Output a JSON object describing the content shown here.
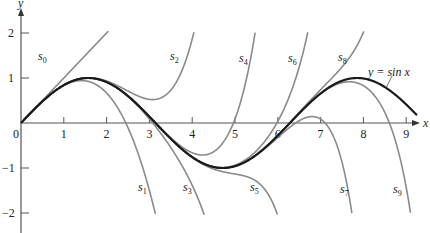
{
  "chart_data": {
    "type": "line",
    "title": "",
    "xlabel": "x",
    "ylabel": "y",
    "xlim": [
      0,
      9.3
    ],
    "ylim": [
      -2.2,
      2.6
    ],
    "grid": false,
    "x_ticks": [
      "0",
      "1",
      "2",
      "3",
      "4",
      "5",
      "6",
      "7",
      "8",
      "9"
    ],
    "y_ticks": [
      "-2",
      "-1",
      "1",
      "2"
    ],
    "series": [
      {
        "name": "y = sin x",
        "function": "sin(x)",
        "style": "dark"
      },
      {
        "name": "s0",
        "function": "x"
      },
      {
        "name": "s1",
        "function": "x - x^3/3!"
      },
      {
        "name": "s2",
        "function": "x - x^3/3! + x^5/5!"
      },
      {
        "name": "s3",
        "function": "sum_{k=0..3} (-1)^k x^(2k+1)/(2k+1)!"
      },
      {
        "name": "s4",
        "function": "sum_{k=0..4} (-1)^k x^(2k+1)/(2k+1)!"
      },
      {
        "name": "s5",
        "function": "sum_{k=0..5} (-1)^k x^(2k+1)/(2k+1)!"
      },
      {
        "name": "s6",
        "function": "sum_{k=0..6} (-1)^k x^(2k+1)/(2k+1)!"
      },
      {
        "name": "s7",
        "function": "sum_{k=0..7} (-1)^k x^(2k+1)/(2k+1)!"
      },
      {
        "name": "s8",
        "function": "sum_{k=0..8} (-1)^k x^(2k+1)/(2k+1)!"
      },
      {
        "name": "s9",
        "function": "sum_{k=0..9} (-1)^k x^(2k+1)/(2k+1)!"
      }
    ],
    "annotations": [
      {
        "text": "s0",
        "x": 0.55,
        "y": 1.45
      },
      {
        "text": "s2",
        "x": 3.55,
        "y": 1.45
      },
      {
        "text": "s4",
        "x": 5.15,
        "y": 1.4
      },
      {
        "text": "s6",
        "x": 6.3,
        "y": 1.4
      },
      {
        "text": "s8",
        "x": 7.5,
        "y": 1.4
      },
      {
        "text": "y = sin x",
        "x": 8.1,
        "y": 1.1
      },
      {
        "text": "s1",
        "x": 2.85,
        "y": -1.5
      },
      {
        "text": "s3",
        "x": 3.85,
        "y": -1.5
      },
      {
        "text": "s5",
        "x": 5.4,
        "y": -1.5
      },
      {
        "text": "s7",
        "x": 7.5,
        "y": -1.5
      },
      {
        "text": "s9",
        "x": 8.75,
        "y": -1.5
      }
    ]
  },
  "axes": {
    "x_label": "x",
    "y_label": "y",
    "origin_label": "0"
  },
  "labels": {
    "s0": {
      "base": "s",
      "sub": "0"
    },
    "s1": {
      "base": "s",
      "sub": "1"
    },
    "s2": {
      "base": "s",
      "sub": "2"
    },
    "s3": {
      "base": "s",
      "sub": "3"
    },
    "s4": {
      "base": "s",
      "sub": "4"
    },
    "s5": {
      "base": "s",
      "sub": "5"
    },
    "s6": {
      "base": "s",
      "sub": "6"
    },
    "s7": {
      "base": "s",
      "sub": "7"
    },
    "s8": {
      "base": "s",
      "sub": "8"
    },
    "s9": {
      "base": "s",
      "sub": "9"
    },
    "sin": "y = sin x"
  }
}
